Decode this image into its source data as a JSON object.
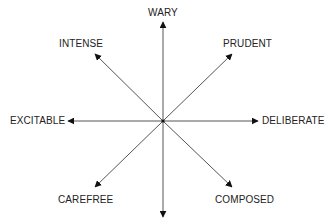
{
  "diagram": {
    "center": {
      "x": 163,
      "y": 121
    },
    "line_color": "#555555",
    "label_color": "#222222",
    "axes": [
      {
        "label": "WARY",
        "direction": "up"
      },
      {
        "label": "PRUDENT",
        "direction": "up-right"
      },
      {
        "label": "DELIBERATE",
        "direction": "right"
      },
      {
        "label": "COMPOSED",
        "direction": "down-right"
      },
      {
        "label": "",
        "direction": "down"
      },
      {
        "label": "CAREFREE",
        "direction": "down-left"
      },
      {
        "label": "EXCITABLE",
        "direction": "left"
      },
      {
        "label": "INTENSE",
        "direction": "up-left"
      }
    ]
  }
}
